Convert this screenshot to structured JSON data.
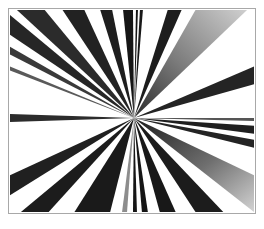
{
  "artwork": {
    "title": "Radial Starburst",
    "kind": "abstract-radial-wedge-composition",
    "canvas": {
      "width": 264,
      "height": 229
    },
    "frame": {
      "x": 8,
      "y": 8,
      "width": 248,
      "height": 206,
      "border_color": "#a8a8a8",
      "border_width": 1
    },
    "background_color": "#ffffff",
    "vanishing_point": {
      "x": 134,
      "y": 118
    },
    "palette": {
      "black": "#111111",
      "near_black": "#1b1b1b",
      "dark_gray": "#2e2e2e",
      "mid_gray": "#6b6b6b",
      "light_gray": "#b9b9b9",
      "pale_gray": "#d8d8d8",
      "white": "#ffffff"
    },
    "wedges": [
      {
        "id": "w01",
        "edge": "top",
        "a_x": 16,
        "a_y": 9,
        "b_x": 44,
        "b_y": 9,
        "fill": "#2b2b2b",
        "grad": "none"
      },
      {
        "id": "w02",
        "edge": "left",
        "a_x": 9,
        "a_y": 14,
        "b_x": 9,
        "b_y": 34,
        "fill": "#262626",
        "grad": "none"
      },
      {
        "id": "w03",
        "edge": "left",
        "a_x": 9,
        "a_y": 46,
        "b_x": 9,
        "b_y": 54,
        "fill": "#3a3a3a",
        "grad": "none"
      },
      {
        "id": "w04",
        "edge": "left",
        "a_x": 9,
        "a_y": 66,
        "b_x": 9,
        "b_y": 70,
        "fill": "#5a5a5a",
        "grad": "none"
      },
      {
        "id": "w05",
        "edge": "top",
        "a_x": 62,
        "a_y": 9,
        "b_x": 84,
        "b_y": 9,
        "fill": "#222222",
        "grad": "none"
      },
      {
        "id": "w06",
        "edge": "top",
        "a_x": 100,
        "a_y": 9,
        "b_x": 112,
        "b_y": 9,
        "fill": "#1e1e1e",
        "grad": "none"
      },
      {
        "id": "w07",
        "edge": "top",
        "a_x": 123,
        "a_y": 9,
        "b_x": 133,
        "b_y": 9,
        "fill": "#161616",
        "grad": "none"
      },
      {
        "id": "w08",
        "edge": "top",
        "a_x": 136,
        "a_y": 9,
        "b_x": 138,
        "b_y": 9,
        "fill": "#141414",
        "grad": "none"
      },
      {
        "id": "w09",
        "edge": "top",
        "a_x": 140,
        "a_y": 9,
        "b_x": 143,
        "b_y": 9,
        "fill": "#181818",
        "grad": "none"
      },
      {
        "id": "w10",
        "edge": "top",
        "a_x": 168,
        "a_y": 9,
        "b_x": 182,
        "b_y": 9,
        "fill": "#1d1d1d",
        "grad": "none"
      },
      {
        "id": "w11",
        "edge": "top",
        "a_x": 196,
        "a_y": 9,
        "b_x": 248,
        "b_y": 9,
        "fill": "#3a3a3a",
        "grad": "to-light"
      },
      {
        "id": "w12",
        "edge": "right",
        "a_x": 255,
        "a_y": 66,
        "b_x": 255,
        "b_y": 84,
        "fill": "#242424",
        "grad": "none"
      },
      {
        "id": "w13",
        "edge": "right",
        "a_x": 255,
        "a_y": 126,
        "b_x": 255,
        "b_y": 134,
        "fill": "#1f1f1f",
        "grad": "none"
      },
      {
        "id": "w14",
        "edge": "right",
        "a_x": 255,
        "a_y": 140,
        "b_x": 255,
        "b_y": 148,
        "fill": "#242424",
        "grad": "none"
      },
      {
        "id": "w15",
        "edge": "right",
        "a_x": 255,
        "a_y": 176,
        "b_x": 255,
        "b_y": 213,
        "fill": "#2a2a2a",
        "grad": "to-light"
      },
      {
        "id": "w16",
        "edge": "bottom",
        "a_x": 196,
        "a_y": 213,
        "b_x": 224,
        "b_y": 213,
        "fill": "#1c1c1c",
        "grad": "none"
      },
      {
        "id": "w17",
        "edge": "bottom",
        "a_x": 160,
        "a_y": 213,
        "b_x": 176,
        "b_y": 213,
        "fill": "#181818",
        "grad": "none"
      },
      {
        "id": "w18",
        "edge": "bottom",
        "a_x": 142,
        "a_y": 213,
        "b_x": 148,
        "b_y": 213,
        "fill": "#151515",
        "grad": "none"
      },
      {
        "id": "w19",
        "edge": "bottom",
        "a_x": 133,
        "a_y": 213,
        "b_x": 137,
        "b_y": 213,
        "fill": "#161616",
        "grad": "none"
      },
      {
        "id": "w20",
        "edge": "bottom",
        "a_x": 122,
        "a_y": 213,
        "b_x": 127,
        "b_y": 213,
        "fill": "#8d8d8d",
        "grad": "none"
      },
      {
        "id": "w21",
        "edge": "bottom",
        "a_x": 74,
        "a_y": 213,
        "b_x": 110,
        "b_y": 213,
        "fill": "#1a1a1a",
        "grad": "none"
      },
      {
        "id": "w22",
        "edge": "bottom",
        "a_x": 20,
        "a_y": 213,
        "b_x": 48,
        "b_y": 213,
        "fill": "#1c1c1c",
        "grad": "none"
      },
      {
        "id": "w23",
        "edge": "left",
        "a_x": 9,
        "a_y": 176,
        "b_x": 9,
        "b_y": 196,
        "fill": "#202020",
        "grad": "none"
      },
      {
        "id": "w24",
        "edge": "left",
        "a_x": 9,
        "a_y": 114,
        "b_x": 9,
        "b_y": 122,
        "fill": "#2c2c2c",
        "grad": "none"
      },
      {
        "id": "w25",
        "edge": "right",
        "a_x": 255,
        "a_y": 118,
        "b_x": 255,
        "b_y": 121,
        "fill": "#555555",
        "grad": "none"
      }
    ]
  }
}
